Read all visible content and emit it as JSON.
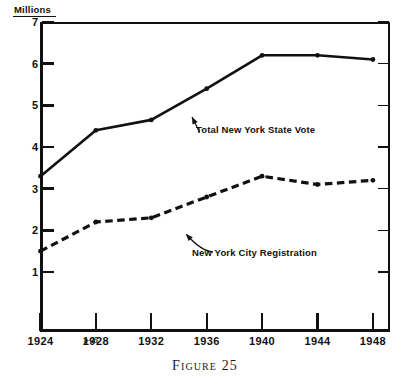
{
  "figure": {
    "caption_label": "Figure",
    "caption_number": "25",
    "page_mark": "p-25",
    "units_label": "Millions"
  },
  "chart_data": {
    "type": "line",
    "title": "",
    "xlabel": "",
    "ylabel": "Millions",
    "categories": [
      "1924",
      "1928",
      "1932",
      "1936",
      "1940",
      "1944",
      "1948"
    ],
    "x": [
      1924,
      1928,
      1932,
      1936,
      1940,
      1944,
      1948
    ],
    "xlim": [
      1922,
      1950
    ],
    "ylim": [
      0,
      7
    ],
    "yticks": [
      1,
      2,
      3,
      4,
      5,
      6,
      7
    ],
    "ytick_labels": [
      "1",
      "2",
      "3",
      "4",
      "5",
      "6",
      "7"
    ],
    "grid": false,
    "legend": "inline-annotations",
    "series": [
      {
        "name": "Total New York State Vote",
        "style": "solid",
        "color": "#111111",
        "values": [
          3.3,
          4.4,
          4.65,
          5.4,
          6.2,
          6.2,
          6.1
        ]
      },
      {
        "name": "New York City Registration",
        "style": "dashed",
        "color": "#111111",
        "values": [
          1.5,
          2.2,
          2.3,
          2.8,
          3.3,
          3.1,
          3.2
        ]
      }
    ],
    "annotations": [
      {
        "text": "Total New York State Vote",
        "target_x": 1937.6,
        "target_y": 5.62,
        "arrow": "straight"
      },
      {
        "text": "New York City Registration",
        "target_x": 1936.4,
        "target_y": 2.74,
        "arrow": "curved"
      }
    ]
  }
}
